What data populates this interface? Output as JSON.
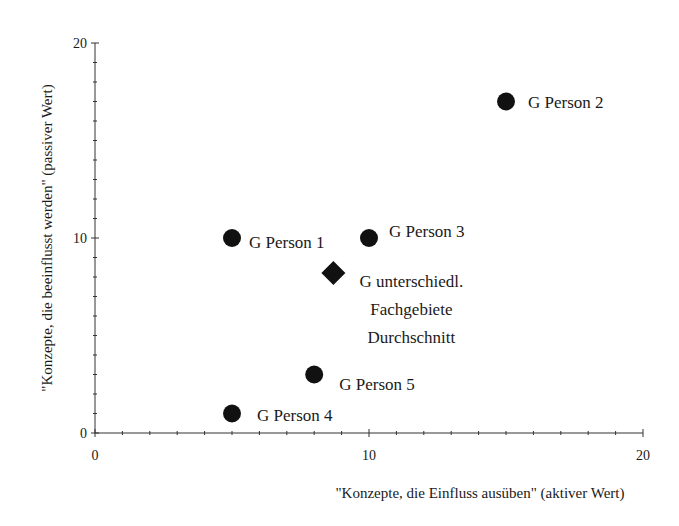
{
  "chart_data": {
    "type": "scatter",
    "title": "",
    "xlabel": "\"Konzepte, die Einfluss ausüben\" (aktiver Wert)",
    "ylabel": "\"Konzepte, die beeinflusst werden\" (passiver Wert)",
    "xlim": [
      0,
      20
    ],
    "ylim": [
      0,
      20
    ],
    "x_ticks": [
      0,
      10,
      20
    ],
    "y_ticks": [
      0,
      10,
      20
    ],
    "x_tick_labels": [
      "0",
      "10",
      "20"
    ],
    "y_tick_labels": [
      "0",
      "10",
      "20"
    ],
    "minor_ticks_per_major": 10,
    "grid": false,
    "legend": "none",
    "series": [
      {
        "name": "Personen",
        "marker": "circle",
        "color": "#111111",
        "points": [
          {
            "label": "G Person 1",
            "x": 5,
            "y": 10
          },
          {
            "label": "G Person 2",
            "x": 15,
            "y": 17
          },
          {
            "label": "G Person 3",
            "x": 10,
            "y": 10
          },
          {
            "label": "G Person 4",
            "x": 5,
            "y": 1
          },
          {
            "label": "G Person 5",
            "x": 8,
            "y": 3
          }
        ]
      },
      {
        "name": "Durchschnitt",
        "marker": "diamond",
        "color": "#111111",
        "points": [
          {
            "label": "G unterschiedl. Fachgebiete Durchschnitt",
            "label_lines": [
              "G unterschiedl.",
              "Fachgebiete",
              "Durchschnitt"
            ],
            "x": 8.7,
            "y": 8.2
          }
        ]
      }
    ]
  }
}
